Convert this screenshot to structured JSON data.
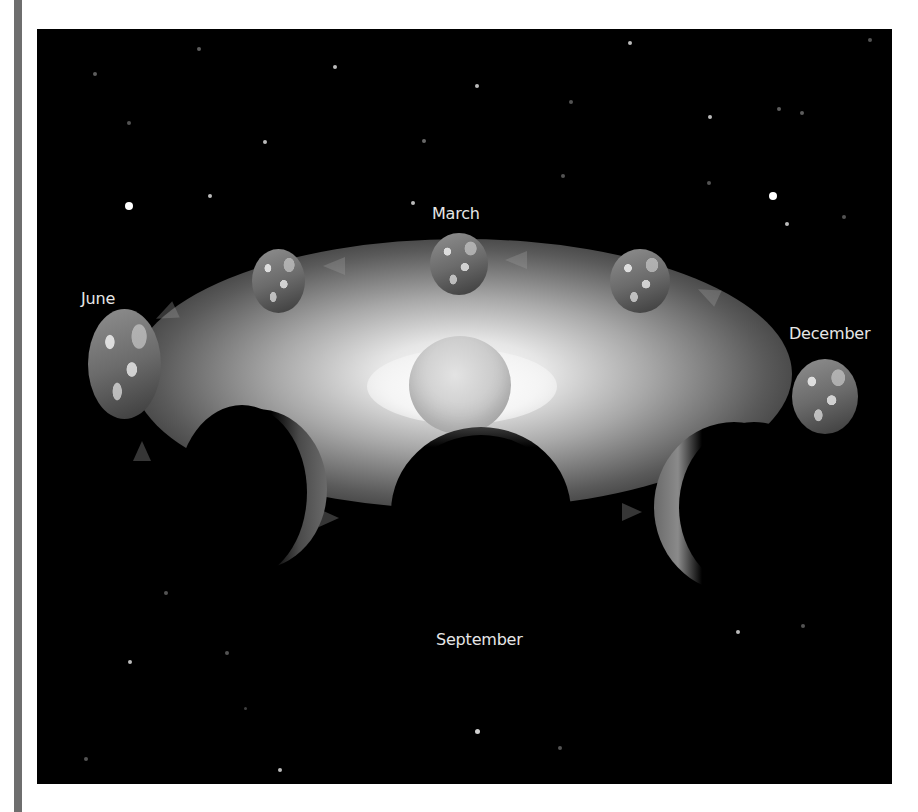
{
  "figure": {
    "background_color": "#000000",
    "labels": {
      "march": "March",
      "june": "June",
      "september": "September",
      "december": "December"
    },
    "elements": {
      "sun": "sun",
      "earth_positions": 8,
      "orbit_direction": "counter-clockwise arrows"
    }
  }
}
